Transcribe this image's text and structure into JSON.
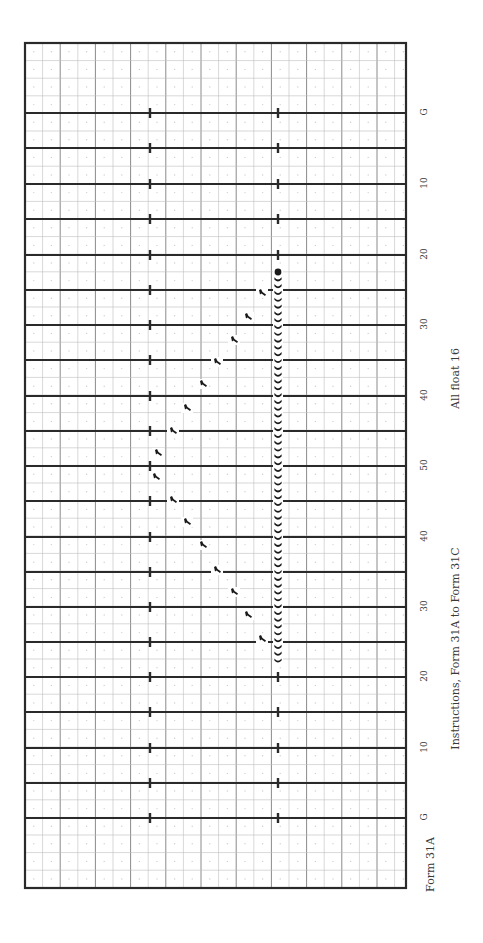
{
  "form": {
    "id_label": "Form 31A",
    "instructions": "Instructions, Form 31A to Form 31C",
    "note": "All float 16"
  },
  "field": {
    "frame": {
      "x": 25,
      "y": 43,
      "w": 381,
      "h": 845
    },
    "orientation": "rotated 90deg; yard lines horizontal, end zones top and bottom",
    "yard_lines": [
      {
        "label": "G",
        "y": 113
      },
      {
        "label": "",
        "y": 148
      },
      {
        "label": "10",
        "y": 184
      },
      {
        "label": "",
        "y": 219
      },
      {
        "label": "20",
        "y": 255
      },
      {
        "label": "",
        "y": 290
      },
      {
        "label": "30",
        "y": 325
      },
      {
        "label": "",
        "y": 360
      },
      {
        "label": "40",
        "y": 396
      },
      {
        "label": "",
        "y": 431
      },
      {
        "label": "50",
        "y": 466
      },
      {
        "label": "",
        "y": 501
      },
      {
        "label": "40",
        "y": 537
      },
      {
        "label": "",
        "y": 572
      },
      {
        "label": "30",
        "y": 607
      },
      {
        "label": "",
        "y": 642
      },
      {
        "label": "20",
        "y": 677
      },
      {
        "label": "",
        "y": 712
      },
      {
        "label": "10",
        "y": 748
      },
      {
        "label": "",
        "y": 783
      },
      {
        "label": "G",
        "y": 818
      }
    ],
    "hash_marks_x": [
      150,
      278
    ],
    "grid_step": 17.6,
    "colors": {
      "line": "#2a2a2a",
      "grid": "#bdbdbd",
      "dots": "#cfcfcf",
      "marker": "#1a1a1a"
    }
  },
  "drill": {
    "dot_column": {
      "x": 278,
      "y_start": 272,
      "y_end": 660,
      "count": 58
    },
    "arc_markers": [
      {
        "x": 262,
        "y": 293
      },
      {
        "x": 248,
        "y": 317
      },
      {
        "x": 234,
        "y": 340
      },
      {
        "x": 217,
        "y": 362
      },
      {
        "x": 203,
        "y": 384
      },
      {
        "x": 187,
        "y": 408
      },
      {
        "x": 173,
        "y": 431
      },
      {
        "x": 158,
        "y": 453
      },
      {
        "x": 156,
        "y": 477
      },
      {
        "x": 173,
        "y": 500
      },
      {
        "x": 187,
        "y": 522
      },
      {
        "x": 203,
        "y": 545
      },
      {
        "x": 217,
        "y": 570
      },
      {
        "x": 234,
        "y": 592
      },
      {
        "x": 248,
        "y": 615
      },
      {
        "x": 262,
        "y": 639
      }
    ]
  }
}
